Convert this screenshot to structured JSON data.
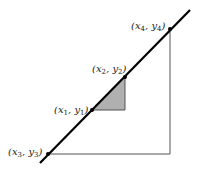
{
  "diagram": {
    "type": "slope-similar-triangles",
    "line": {
      "x1": 40,
      "y1": 163,
      "x2": 190,
      "y2": 10,
      "color": "#000000"
    },
    "points": [
      {
        "id": "p1",
        "label": "x",
        "sub": "1",
        "label2": "y",
        "sub2": "1",
        "x": 92,
        "y": 110,
        "lx": 54,
        "ly": 113
      },
      {
        "id": "p2",
        "label": "x",
        "sub": "2",
        "label2": "y",
        "sub2": "2",
        "x": 125,
        "y": 77,
        "lx": 92,
        "ly": 72
      },
      {
        "id": "p3",
        "label": "x",
        "sub": "3",
        "label2": "y",
        "sub2": "3",
        "x": 48,
        "y": 154,
        "lx": 8,
        "ly": 155
      },
      {
        "id": "p4",
        "label": "x",
        "sub": "4",
        "label2": "y",
        "sub2": "4",
        "x": 170,
        "y": 29,
        "lx": 131,
        "ly": 29
      }
    ],
    "small_triangle": {
      "fill": "#b0b0b0",
      "stroke": "#555555"
    },
    "large_triangle": {
      "stroke": "#555555"
    }
  }
}
